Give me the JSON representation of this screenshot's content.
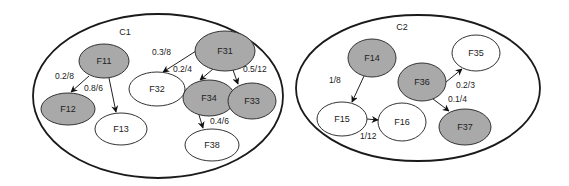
{
  "clusters": [
    {
      "id": "C1",
      "label": "C1",
      "cx": 158,
      "cy": 96,
      "rx": 125,
      "ry": 82,
      "label_x": 125,
      "label_y": 35
    },
    {
      "id": "C2",
      "label": "C2",
      "cx": 418,
      "cy": 88,
      "rx": 122,
      "ry": 73,
      "label_x": 402,
      "label_y": 30
    }
  ],
  "nodes": [
    {
      "id": "F11",
      "label": "F11",
      "cluster": "C1",
      "shaded": true,
      "cx": 104,
      "cy": 61,
      "rx": 25,
      "ry": 17
    },
    {
      "id": "F12",
      "label": "F12",
      "cluster": "C1",
      "shaded": true,
      "cx": 68,
      "cy": 109,
      "rx": 27,
      "ry": 16
    },
    {
      "id": "F13",
      "label": "F13",
      "cluster": "C1",
      "shaded": false,
      "cx": 121,
      "cy": 129,
      "rx": 26,
      "ry": 16
    },
    {
      "id": "F32",
      "label": "F32",
      "cluster": "C1",
      "shaded": false,
      "cx": 157,
      "cy": 89,
      "rx": 28,
      "ry": 17
    },
    {
      "id": "F31",
      "label": "F31",
      "cluster": "C1",
      "shaded": true,
      "cx": 225,
      "cy": 51,
      "rx": 30,
      "ry": 20
    },
    {
      "id": "F34",
      "label": "F34",
      "cluster": "C1",
      "shaded": true,
      "cx": 209,
      "cy": 98,
      "rx": 26,
      "ry": 18
    },
    {
      "id": "F33",
      "label": "F33",
      "cluster": "C1",
      "shaded": true,
      "cx": 252,
      "cy": 101,
      "rx": 24,
      "ry": 18
    },
    {
      "id": "F38",
      "label": "F38",
      "cluster": "C1",
      "shaded": false,
      "cx": 212,
      "cy": 145,
      "rx": 27,
      "ry": 16
    },
    {
      "id": "F14",
      "label": "F14",
      "cluster": "C2",
      "shaded": true,
      "cx": 372,
      "cy": 58,
      "rx": 24,
      "ry": 19
    },
    {
      "id": "F15",
      "label": "F15",
      "cluster": "C2",
      "shaded": false,
      "cx": 342,
      "cy": 119,
      "rx": 25,
      "ry": 17
    },
    {
      "id": "F16",
      "label": "F16",
      "cluster": "C2",
      "shaded": false,
      "cx": 402,
      "cy": 122,
      "rx": 24,
      "ry": 19
    },
    {
      "id": "F36",
      "label": "F36",
      "cluster": "C2",
      "shaded": true,
      "cx": 422,
      "cy": 82,
      "rx": 24,
      "ry": 19
    },
    {
      "id": "F35",
      "label": "F35",
      "cluster": "C2",
      "shaded": false,
      "cx": 476,
      "cy": 53,
      "rx": 24,
      "ry": 18
    },
    {
      "id": "F37",
      "label": "F37",
      "cluster": "C2",
      "shaded": true,
      "cx": 465,
      "cy": 127,
      "rx": 26,
      "ry": 18
    }
  ],
  "edges": [
    {
      "from": "F11",
      "to": "F12",
      "label": "0.2/8",
      "x1": 89,
      "y1": 76,
      "x2": 71,
      "y2": 92,
      "lx": 55,
      "ly": 79
    },
    {
      "from": "F11",
      "to": "F13",
      "label": "0.8/6",
      "x1": 109,
      "y1": 78,
      "x2": 116,
      "y2": 112,
      "lx": 84,
      "ly": 91
    },
    {
      "from": "F31",
      "to": "F32",
      "label": "0.3/8",
      "x1": 196,
      "y1": 51,
      "x2": 163,
      "y2": 72,
      "lx": 152,
      "ly": 55
    },
    {
      "from": "F31",
      "to": "F34",
      "label": "0.2/4",
      "x1": 213,
      "y1": 69,
      "x2": 200,
      "y2": 80,
      "lx": 173,
      "ly": 72
    },
    {
      "from": "F31",
      "to": "F33",
      "label": "0.5/12",
      "x1": 233,
      "y1": 70,
      "x2": 238,
      "y2": 84,
      "lx": 243,
      "ly": 72
    },
    {
      "from": "F34",
      "to": "F38",
      "label": "0.4/6",
      "x1": 199,
      "y1": 115,
      "x2": 203,
      "y2": 128,
      "lx": 210,
      "ly": 124
    },
    {
      "from": "F14",
      "to": "F15",
      "label": "1/8",
      "x1": 364,
      "y1": 76,
      "x2": 352,
      "y2": 102,
      "lx": 329,
      "ly": 83
    },
    {
      "from": "F15",
      "to": "F16",
      "label": "1/12",
      "x1": 367,
      "y1": 119,
      "x2": 378,
      "y2": 120,
      "lx": 360,
      "ly": 139
    },
    {
      "from": "F36",
      "to": "F35",
      "label": "0.2/3",
      "x1": 446,
      "y1": 82,
      "x2": 462,
      "y2": 69,
      "lx": 456,
      "ly": 88
    },
    {
      "from": "F36",
      "to": "F37",
      "label": "0.1/4",
      "x1": 433,
      "y1": 99,
      "x2": 449,
      "y2": 111,
      "lx": 448,
      "ly": 102
    }
  ],
  "colors": {
    "shaded_fill": "#a9a9a9",
    "outline": "#1a1a1a",
    "background": "#ffffff"
  }
}
